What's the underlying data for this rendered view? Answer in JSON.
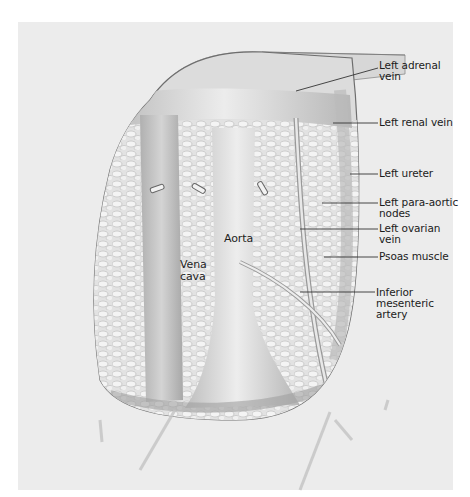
{
  "figure": {
    "type": "anatomical illustration",
    "background_color": "#ececec"
  },
  "labels_inside": {
    "vena_cava": "Vena\ncava",
    "aorta": "Aorta"
  },
  "labels_right": [
    {
      "id": "left-adrenal-vein",
      "text": "Left adrenal\nvein"
    },
    {
      "id": "left-renal-vein",
      "text": "Left renal vein"
    },
    {
      "id": "left-ureter",
      "text": "Left ureter"
    },
    {
      "id": "left-para-aortic-nodes",
      "text": "Left para-aortic\nnodes"
    },
    {
      "id": "left-ovarian-vein",
      "text": "Left ovarian\nvein"
    },
    {
      "id": "psoas-muscle",
      "text": "Psoas muscle"
    },
    {
      "id": "inferior-mesenteric-artery",
      "text": "Inferior\nmesenteric\nartery"
    }
  ]
}
